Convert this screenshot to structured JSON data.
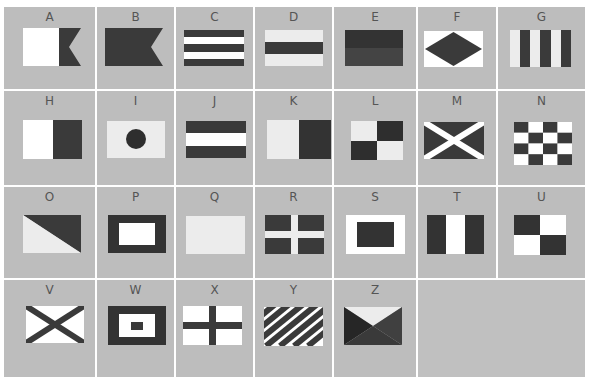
{
  "colors": {
    "background": "#bdbdbd",
    "dark": "#3a3a3a",
    "light": "#ffffff",
    "pale": "#ececec",
    "grid_line": "#ffffff",
    "letter": "#555555"
  },
  "flags": [
    {
      "letter": "A",
      "pattern": "swallowtail-split-light-dark"
    },
    {
      "letter": "B",
      "pattern": "swallowtail-solid-dark"
    },
    {
      "letter": "C",
      "pattern": "five-horizontal-stripes"
    },
    {
      "letter": "D",
      "pattern": "three-horizontal-bands-dark-center"
    },
    {
      "letter": "E",
      "pattern": "two-horizontal-halves"
    },
    {
      "letter": "F",
      "pattern": "diamond-on-light"
    },
    {
      "letter": "G",
      "pattern": "six-vertical-stripes"
    },
    {
      "letter": "H",
      "pattern": "two-vertical-halves-light-dark"
    },
    {
      "letter": "I",
      "pattern": "dark-circle-on-light"
    },
    {
      "letter": "J",
      "pattern": "three-horizontal-bands-light-center"
    },
    {
      "letter": "K",
      "pattern": "two-vertical-halves-pale-dark"
    },
    {
      "letter": "L",
      "pattern": "quartered-checker"
    },
    {
      "letter": "M",
      "pattern": "white-saltire-on-dark"
    },
    {
      "letter": "N",
      "pattern": "checkerboard-4x4"
    },
    {
      "letter": "O",
      "pattern": "diagonal-split"
    },
    {
      "letter": "P",
      "pattern": "dark-border-light-center"
    },
    {
      "letter": "Q",
      "pattern": "solid-pale"
    },
    {
      "letter": "R",
      "pattern": "light-cross-on-dark"
    },
    {
      "letter": "S",
      "pattern": "light-border-dark-center"
    },
    {
      "letter": "T",
      "pattern": "three-vertical-bands-light-center"
    },
    {
      "letter": "U",
      "pattern": "quartered-dark-light"
    },
    {
      "letter": "V",
      "pattern": "dark-saltire-on-light"
    },
    {
      "letter": "W",
      "pattern": "concentric-rectangles"
    },
    {
      "letter": "X",
      "pattern": "dark-cross-on-light"
    },
    {
      "letter": "Y",
      "pattern": "diagonal-stripes"
    },
    {
      "letter": "Z",
      "pattern": "four-triangles"
    }
  ]
}
